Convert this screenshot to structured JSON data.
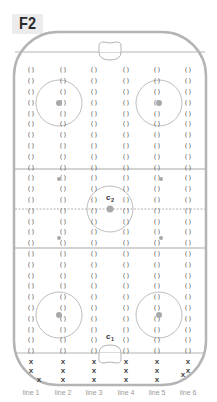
{
  "title": "F2",
  "rink": {
    "x": 14,
    "y": 32,
    "width": 192,
    "height": 353,
    "corner_radius": 44,
    "border_color": "#b4b4b4",
    "top_goal_line_y": 52,
    "bottom_goal_line_y": 353,
    "top_blue_line_y": 169,
    "center_line_y": 209,
    "bottom_blue_line_y": 248,
    "crease_top": {
      "cx": 110,
      "y": 52
    },
    "crease_bottom": {
      "cx": 110,
      "y": 353
    }
  },
  "circles": [
    {
      "name": "top-left-faceoff-circle",
      "cx": 59,
      "cy": 103,
      "r": 23
    },
    {
      "name": "top-right-faceoff-circle",
      "cx": 159,
      "cy": 103,
      "r": 23
    },
    {
      "name": "center-circle",
      "cx": 110,
      "cy": 209,
      "r": 23
    },
    {
      "name": "bottom-left-faceoff-circle",
      "cx": 59,
      "cy": 315,
      "r": 23
    },
    {
      "name": "bottom-right-faceoff-circle",
      "cx": 159,
      "cy": 315,
      "r": 23
    }
  ],
  "dots": [
    {
      "cx": 59,
      "cy": 103,
      "r": 3
    },
    {
      "cx": 159,
      "cy": 103,
      "r": 3
    },
    {
      "cx": 110,
      "cy": 209,
      "r": 3.5
    },
    {
      "cx": 59,
      "cy": 315,
      "r": 3
    },
    {
      "cx": 159,
      "cy": 315,
      "r": 3
    },
    {
      "cx": 59,
      "cy": 179,
      "r": 2
    },
    {
      "cx": 161,
      "cy": 179,
      "r": 2
    },
    {
      "cx": 59,
      "cy": 238,
      "r": 2
    },
    {
      "cx": 161,
      "cy": 238,
      "r": 2
    }
  ],
  "markers": [
    {
      "label": "c",
      "sub": "2",
      "x": 109,
      "y": 197
    },
    {
      "label": "c",
      "sub": "1",
      "x": 109,
      "y": 336
    }
  ],
  "columns": [
    {
      "label": "line 1",
      "x": 31
    },
    {
      "label": "line 2",
      "x": 63
    },
    {
      "label": "line 3",
      "x": 94
    },
    {
      "label": "line 4",
      "x": 126
    },
    {
      "label": "line 5",
      "x": 157
    },
    {
      "label": "line 6",
      "x": 188
    }
  ],
  "position_glyph": "()",
  "position_rows": {
    "start_y": 70,
    "step": 10.8,
    "count": 27
  },
  "x_glyph": "x",
  "x_marks": [
    {
      "col": 0,
      "dx": 0,
      "y": 361
    },
    {
      "col": 0,
      "dx": 0,
      "y": 370
    },
    {
      "col": 0,
      "dx": 8,
      "y": 379
    },
    {
      "col": 1,
      "dx": 0,
      "y": 361
    },
    {
      "col": 1,
      "dx": 0,
      "y": 370
    },
    {
      "col": 1,
      "dx": 0,
      "y": 379
    },
    {
      "col": 2,
      "dx": 0,
      "y": 361
    },
    {
      "col": 2,
      "dx": 0,
      "y": 370
    },
    {
      "col": 2,
      "dx": 0,
      "y": 379
    },
    {
      "col": 3,
      "dx": 0,
      "y": 361
    },
    {
      "col": 3,
      "dx": 0,
      "y": 370
    },
    {
      "col": 3,
      "dx": 0,
      "y": 379
    },
    {
      "col": 4,
      "dx": 0,
      "y": 361
    },
    {
      "col": 4,
      "dx": 0,
      "y": 370
    },
    {
      "col": 4,
      "dx": 0,
      "y": 379
    },
    {
      "col": 5,
      "dx": 0,
      "y": 361
    },
    {
      "col": 5,
      "dx": 0,
      "y": 370
    },
    {
      "col": 5,
      "dx": -5,
      "y": 374
    }
  ],
  "labels_y": 395
}
